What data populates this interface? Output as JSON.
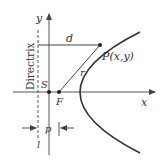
{
  "diagram": {
    "labels": {
      "y_axis": "y",
      "x_axis": "x",
      "directrix": "Directrix",
      "distance_d": "d",
      "point_p": "P(x,y)",
      "distance_r": "r",
      "vertex": "S",
      "focus": "F",
      "parameter_p": "p",
      "line_l": "l"
    },
    "colors": {
      "line": "#333333",
      "axis": "#555555",
      "background": "#ffffff"
    }
  }
}
